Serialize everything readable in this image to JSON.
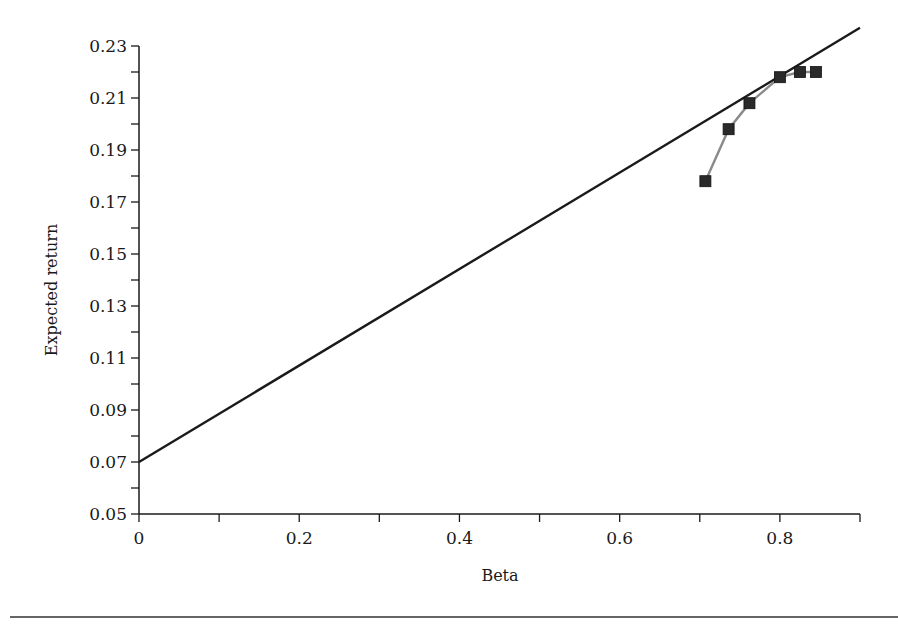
{
  "chart_data": {
    "type": "line",
    "title": "",
    "xlabel": "Beta",
    "ylabel": "Expected return",
    "xlim": [
      0,
      0.9
    ],
    "ylim": [
      0.05,
      0.23
    ],
    "x_ticks": [
      0,
      0.1,
      0.2,
      0.3,
      0.4,
      0.5,
      0.6,
      0.7,
      0.8,
      0.9
    ],
    "x_tick_labels": [
      "0",
      "",
      "0.2",
      "",
      "0.4",
      "",
      "0.6",
      "",
      "0.8",
      ""
    ],
    "y_ticks": [
      0.05,
      0.06,
      0.07,
      0.08,
      0.09,
      0.1,
      0.11,
      0.12,
      0.13,
      0.14,
      0.15,
      0.16,
      0.17,
      0.18,
      0.19,
      0.2,
      0.21,
      0.22,
      0.23
    ],
    "y_tick_labels": [
      "0.05",
      "",
      "0.07",
      "",
      "0.09",
      "",
      "0.11",
      "",
      "0.13",
      "",
      "0.15",
      "",
      "0.17",
      "",
      "0.19",
      "",
      "0.21",
      "",
      "0.23"
    ],
    "grid": false,
    "legend": null,
    "series": [
      {
        "name": "Security market line",
        "style": "solid line, black",
        "color": "#1a1a1a",
        "x": [
          0,
          0.9
        ],
        "y": [
          0.07,
          0.237
        ]
      },
      {
        "name": "Portfolios",
        "style": "gray line with black square markers",
        "color": "#8a8a8a",
        "marker_color": "#2a2a2a",
        "x": [
          0.707,
          0.736,
          0.762,
          0.8,
          0.825,
          0.845
        ],
        "y": [
          0.178,
          0.198,
          0.208,
          0.218,
          0.22,
          0.22
        ]
      }
    ]
  },
  "labels": {
    "x_axis_title": "Beta",
    "y_axis_title": "Expected return"
  }
}
